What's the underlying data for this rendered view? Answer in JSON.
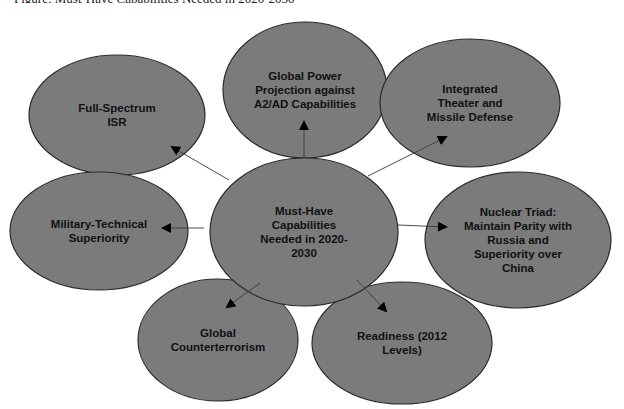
{
  "caption": "Figure: Must-Have Capabilities Needed in 2020-2030",
  "colors": {
    "node_fill": "#7b7b7b",
    "node_stroke": "#2b2b2b",
    "text": "#111111",
    "connector": "#3a3a3a",
    "background": "#ffffff"
  },
  "center": {
    "id": "center",
    "lines": [
      "Must-Have",
      "Capabilities",
      "Needed in 2020-",
      "2030"
    ],
    "cx": 304,
    "cy": 232,
    "rx": 94,
    "ry": 74
  },
  "nodes": [
    {
      "id": "global-power-projection",
      "lines": [
        "Global Power",
        "Projection against",
        "A2/AD Capabilities"
      ],
      "cx": 305,
      "cy": 90,
      "rx": 82,
      "ry": 68,
      "arrow": {
        "x1": 304,
        "y1": 158,
        "x2": 304,
        "y2": 122
      }
    },
    {
      "id": "full-spectrum-isr",
      "lines": [
        "Full-Spectrum",
        "ISR"
      ],
      "cx": 117,
      "cy": 115,
      "rx": 88,
      "ry": 60,
      "arrow": {
        "x1": 229,
        "y1": 180,
        "x2": 172,
        "y2": 147
      }
    },
    {
      "id": "integrated-theater-missile-defense",
      "lines": [
        "Integrated",
        "Theater and",
        "Missile Defense"
      ],
      "cx": 470,
      "cy": 103,
      "rx": 90,
      "ry": 64,
      "arrow": {
        "x1": 368,
        "y1": 176,
        "x2": 446,
        "y2": 137
      }
    },
    {
      "id": "military-technical-superiority",
      "lines": [
        "Military-Technical",
        "Superiority"
      ],
      "cx": 99,
      "cy": 231,
      "rx": 89,
      "ry": 59,
      "arrow": {
        "x1": 204,
        "y1": 228,
        "x2": 163,
        "y2": 228
      }
    },
    {
      "id": "nuclear-triad",
      "lines": [
        "Nuclear Triad:",
        "Maintain Parity with",
        "Russia and",
        "Superiority over",
        "China"
      ],
      "cx": 518,
      "cy": 240,
      "rx": 93,
      "ry": 68,
      "arrow": {
        "x1": 398,
        "y1": 225,
        "x2": 446,
        "y2": 227
      }
    },
    {
      "id": "global-counterterrorism",
      "lines": [
        "Global",
        "Counterterrorism"
      ],
      "cx": 218,
      "cy": 340,
      "rx": 80,
      "ry": 61,
      "arrow": {
        "x1": 260,
        "y1": 283,
        "x2": 227,
        "y2": 307
      }
    },
    {
      "id": "readiness",
      "lines": [
        "Readiness (2012",
        "Levels)"
      ],
      "cx": 402,
      "cy": 343,
      "rx": 90,
      "ry": 61,
      "arrow": {
        "x1": 357,
        "y1": 280,
        "x2": 386,
        "y2": 311
      }
    }
  ]
}
